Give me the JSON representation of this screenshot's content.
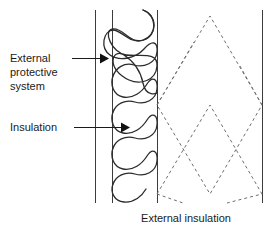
{
  "diagram": {
    "type": "wall-cross-section",
    "caption": "External insulation",
    "labels": [
      {
        "id": "external-protective-system",
        "lines": [
          "External",
          "protective",
          "system"
        ],
        "text": "External protective system",
        "text_x": 10,
        "text_y": 62,
        "line_height": 14,
        "leader": {
          "x1": 72,
          "y1": 65,
          "x2": 100,
          "y2": 65
        },
        "arrow_tip": {
          "x": 106,
          "y": 65
        }
      },
      {
        "id": "insulation",
        "lines": [
          "Insulation"
        ],
        "text": "Insulation",
        "text_x": 10,
        "text_y": 131,
        "line_height": 14,
        "leader": {
          "x1": 73,
          "y1": 127,
          "x2": 122,
          "y2": 127
        },
        "arrow_tip": {
          "x": 129,
          "y": 127
        }
      }
    ],
    "caption_position": {
      "x": 186,
      "y": 222
    },
    "layers": [
      {
        "name": "external-protective-system-line",
        "kind": "vertical-line",
        "x": 95,
        "y_top": 10,
        "y_bottom": 203
      },
      {
        "name": "insulation-band-left-edge",
        "kind": "vertical-line",
        "x": 112,
        "y_top": 10,
        "y_bottom": 203
      },
      {
        "name": "insulation-band-right-edge",
        "kind": "vertical-line",
        "x": 157,
        "y_top": 10,
        "y_bottom": 203
      },
      {
        "name": "substrate-right-edge",
        "kind": "vertical-line",
        "x": 262,
        "y_top": 10,
        "y_bottom": 203
      }
    ],
    "insulation_hatch": {
      "style": "serpentine-loop",
      "x_left": 113,
      "x_right": 156,
      "y_start": 10,
      "y_end": 203,
      "cycles": 7
    },
    "substrate_hatch": {
      "style": "dashed-diamond",
      "x_left": 157,
      "x_right": 262,
      "y_top": 10,
      "y_bottom": 203,
      "diamonds": 2
    },
    "colors": {
      "text": "#1a1a1a",
      "structure_line": "#3c3c3c",
      "hatch_line": "#2b2b2b",
      "dashed_hatch": "#6e6e6e",
      "background": "#ffffff"
    }
  }
}
